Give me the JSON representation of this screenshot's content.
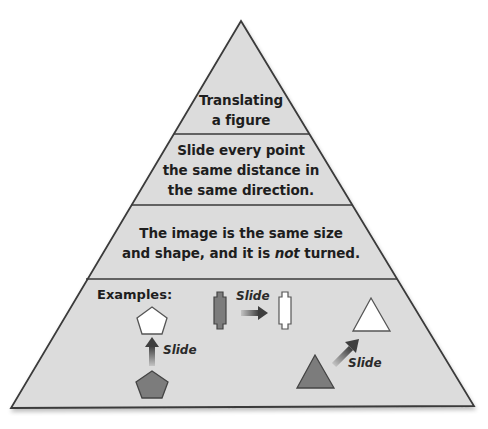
{
  "diagram": {
    "type": "pyramid",
    "colors": {
      "fill": "#dcdcdc",
      "outline": "#3a3a3a",
      "dark_shape": "#7a7a7a",
      "light_shape": "#ffffff",
      "arrow_dark": "#4a4a4a",
      "arrow_light": "#bdbdbd"
    },
    "levels": [
      {
        "lines": [
          "Translating",
          "a figure"
        ]
      },
      {
        "lines": [
          "Slide every point",
          "the same distance in",
          "the same direction."
        ]
      },
      {
        "lines": [
          "The image is the same size",
          "and shape, and it is "
        ],
        "emphasis": "not",
        "tail": " turned."
      },
      {
        "heading": "Examples:"
      }
    ],
    "examples": [
      {
        "shape": "pentagon",
        "direction": "up",
        "label": "Slide"
      },
      {
        "shape": "double-notched-rectangle",
        "direction": "right",
        "label": "Slide"
      },
      {
        "shape": "triangle",
        "direction": "up-right",
        "label": "Slide"
      }
    ]
  }
}
